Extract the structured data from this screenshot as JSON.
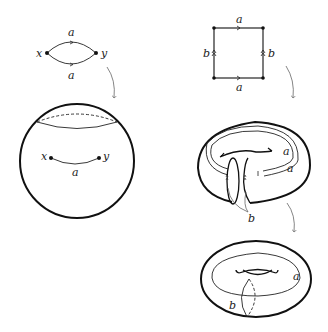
{
  "figure": {
    "left_panel": {
      "graph": {
        "vertices": [
          "x",
          "y"
        ],
        "edges": [
          {
            "label": "a",
            "position": "top"
          },
          {
            "label": "a",
            "position": "bottom"
          }
        ]
      },
      "sphere": {
        "points": [
          "x",
          "y"
        ],
        "arc_label": "a"
      }
    },
    "right_panel": {
      "square": {
        "top_label": "a",
        "bottom_label": "a",
        "left_label": "b",
        "right_label": "b"
      },
      "cut_torus": {
        "labels_a": [
          "a",
          "a"
        ],
        "label_b": "b"
      },
      "torus": {
        "label_a": "a",
        "label_b": "b"
      }
    }
  }
}
